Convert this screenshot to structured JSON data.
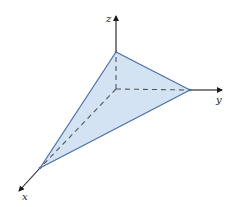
{
  "diagram": {
    "axes": {
      "x": {
        "label": "x"
      },
      "y": {
        "label": "y"
      },
      "z": {
        "label": "z"
      }
    },
    "colors": {
      "plane_fill": "#d4e3f3",
      "plane_edge": "#4a6fa5",
      "axis": "#1a1a1a",
      "hidden_axis_dash": "#555555"
    }
  }
}
